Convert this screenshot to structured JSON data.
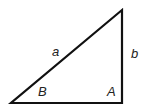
{
  "diagram": {
    "title": "",
    "type": "right-triangle",
    "colors": {
      "stroke": "#111111",
      "text": "#222222",
      "background": "#ffffff"
    },
    "vertices": {
      "bottom_left": [
        11,
        103
      ],
      "bottom_right": [
        122,
        103
      ],
      "top": [
        122,
        10
      ]
    },
    "labels": {
      "hypotenuse": "a",
      "vertical_side": "b",
      "angle_left": "B",
      "angle_right": "A"
    }
  }
}
